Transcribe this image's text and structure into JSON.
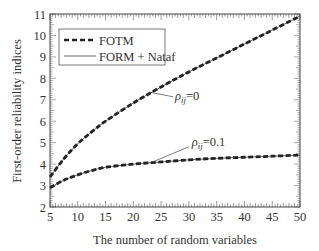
{
  "chart_data": {
    "type": "line",
    "title": "",
    "xlabel": "The number of random variables",
    "ylabel": "First-order reliability indices",
    "xlim": [
      5,
      50
    ],
    "ylim": [
      2,
      11
    ],
    "xticks": [
      5,
      10,
      15,
      20,
      25,
      30,
      35,
      40,
      45,
      50
    ],
    "yticks": [
      2,
      3,
      4,
      5,
      6,
      7,
      8,
      9,
      10,
      11
    ],
    "grid": false,
    "legend_position": "upper left",
    "x": [
      5,
      7.5,
      10,
      12.5,
      15,
      20,
      25,
      30,
      35,
      40,
      45,
      50
    ],
    "series": [
      {
        "name": "FOTM",
        "style": "dashed-thick",
        "group": "rho=0",
        "values": [
          3.4,
          4.25,
          4.95,
          5.5,
          6.0,
          6.85,
          7.6,
          8.3,
          8.95,
          9.6,
          10.25,
          10.9
        ]
      },
      {
        "name": "FORM + Nataf",
        "style": "solid-thin",
        "group": "rho=0",
        "values": [
          3.4,
          4.25,
          4.95,
          5.5,
          6.0,
          6.85,
          7.6,
          8.3,
          8.95,
          9.6,
          10.25,
          10.9
        ]
      },
      {
        "name": "FOTM",
        "style": "dashed-thick",
        "group": "rho=0.1",
        "values": [
          2.9,
          3.25,
          3.5,
          3.7,
          3.85,
          4.0,
          4.1,
          4.2,
          4.27,
          4.32,
          4.37,
          4.42
        ]
      },
      {
        "name": "FORM + Nataf",
        "style": "solid-thin",
        "group": "rho=0.1",
        "values": [
          2.9,
          3.25,
          3.5,
          3.7,
          3.85,
          4.0,
          4.1,
          4.2,
          4.27,
          4.32,
          4.37,
          4.42
        ]
      }
    ],
    "annotations": [
      {
        "text_symbol": "ρ",
        "text_sub": "ij",
        "text_rest": "=0",
        "x": 27.5,
        "y": 7.0,
        "points_to": [
          23,
          7.35
        ]
      },
      {
        "text_symbol": "ρ",
        "text_sub": "ij",
        "text_rest": "=0.1",
        "x": 30.5,
        "y": 4.85,
        "points_to": [
          23,
          4.05
        ]
      }
    ],
    "legend": [
      {
        "label": "FOTM",
        "style": "dashed-thick"
      },
      {
        "label": "FORM + Nataf",
        "style": "solid-thin"
      }
    ]
  },
  "colors": {
    "line": "#222222",
    "axis": "#444444",
    "text": "#333333"
  }
}
